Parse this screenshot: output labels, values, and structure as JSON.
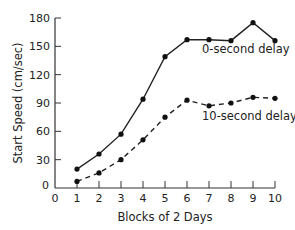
{
  "chart_data": {
    "type": "line",
    "title": "",
    "xlabel": "Blocks of 2 Days",
    "ylabel": "Start Speed (cm/sec)",
    "x": [
      1,
      2,
      3,
      4,
      5,
      6,
      7,
      8,
      9,
      10
    ],
    "xticks": [
      0,
      1,
      2,
      3,
      4,
      5,
      6,
      7,
      8,
      9,
      10
    ],
    "yticks": [
      0,
      30,
      60,
      90,
      120,
      150,
      180
    ],
    "xlim": [
      0,
      10
    ],
    "ylim": [
      0,
      180
    ],
    "grid": false,
    "legend": "inline annotations",
    "series": [
      {
        "name": "0-second delay",
        "style": "solid",
        "values": [
          20,
          36,
          57,
          94,
          139,
          157,
          157,
          156,
          175,
          156
        ]
      },
      {
        "name": "10-second delay",
        "style": "dashed",
        "values": [
          7,
          16,
          30,
          51,
          75,
          93,
          87,
          90,
          96,
          95
        ]
      }
    ],
    "annotations": [
      {
        "text": "0-second delay",
        "series": 0
      },
      {
        "text": "10-second delay",
        "series": 1
      }
    ]
  }
}
